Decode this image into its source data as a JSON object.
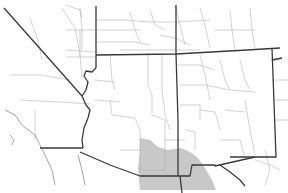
{
  "map": {
    "type": "species range map",
    "region": "Southwestern United States and northern Mexico",
    "colors": {
      "background": "#ffffff",
      "range_fill": "#c8c8c8",
      "state_border": "#3a3a3a",
      "county_border": "#b4b4b4"
    },
    "states_shown": [
      "California",
      "Nevada",
      "Utah",
      "Colorado",
      "Arizona",
      "New Mexico",
      "Texas",
      "Oklahoma",
      "Kansas"
    ],
    "highlighted_range": "Southeastern Arizona, southwestern New Mexico, extending south into Sonora/Chihuahua (Mexico)"
  }
}
